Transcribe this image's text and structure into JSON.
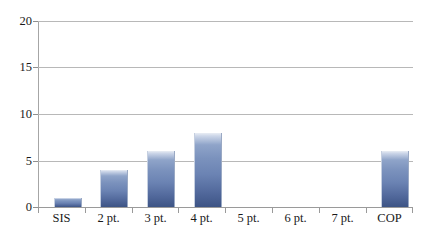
{
  "chart_data": {
    "type": "bar",
    "title": "",
    "subtitle": "",
    "xlabel": "",
    "ylabel": "",
    "categories": [
      "SIS",
      "2 pt.",
      "3 pt.",
      "4 pt.",
      "5 pt.",
      "6 pt.",
      "7 pt.",
      "COP"
    ],
    "values": [
      1,
      4,
      6,
      8,
      0,
      0,
      0,
      6
    ],
    "ylim": [
      0,
      20
    ],
    "yticks": [
      "0",
      "5",
      "10",
      "15",
      "20"
    ],
    "ytick_values": [
      0,
      5,
      10,
      15,
      20
    ],
    "grid": true,
    "legend": false,
    "legend_position": "none",
    "bar_color_top": "#ccd6e8",
    "bar_color_mid": "#6b83b3",
    "bar_color_bottom": "#3d5485",
    "gridline_color": "#b8b8b8",
    "axis_color": "#9a9a9a",
    "background": "#ffffff",
    "text_color": "#1a1a1a"
  }
}
